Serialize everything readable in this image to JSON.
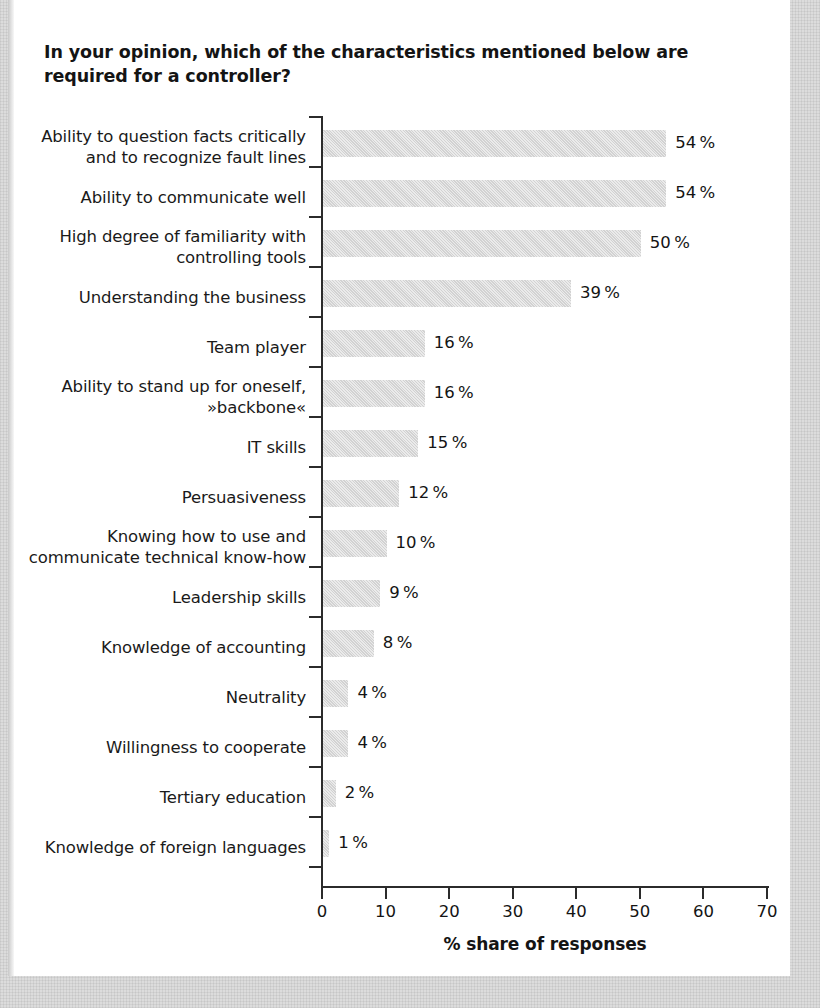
{
  "chart_data": {
    "type": "bar",
    "orientation": "horizontal",
    "title": "In your opinion, which of the characteristics mentioned below are required for a controller?",
    "xlabel": "% share of responses",
    "ylabel": "",
    "xlim": [
      0,
      70
    ],
    "xticks": [
      0,
      10,
      20,
      30,
      40,
      50,
      60,
      70
    ],
    "xtick_labels": [
      "0",
      "10",
      "20",
      "30",
      "40",
      "50",
      "60",
      "70"
    ],
    "grid": false,
    "legend": false,
    "bar_color": "#d2d2d2",
    "axis_color": "#2b2b2b",
    "text_color": "#141414",
    "categories": [
      "Ability to question facts critically and to recognize fault lines",
      "Ability to communicate well",
      "High degree of familiarity with controlling tools",
      "Understanding the business",
      "Team player",
      "Ability to stand up for oneself, »backbone«",
      "IT skills",
      "Persuasiveness",
      "Knowing how to use and communicate technical know-how",
      "Leadership skills",
      "Knowledge of accounting",
      "Neutrality",
      "Willingness to cooperate",
      "Tertiary education",
      "Knowledge of foreign languages"
    ],
    "category_lines": [
      [
        "Ability to question facts critically",
        "and to recognize fault lines"
      ],
      [
        "Ability to communicate well"
      ],
      [
        "High degree of familiarity with",
        "controlling tools"
      ],
      [
        "Understanding the business"
      ],
      [
        "Team player"
      ],
      [
        "Ability to stand up for oneself,",
        "»backbone«"
      ],
      [
        "IT skills"
      ],
      [
        "Persuasiveness"
      ],
      [
        "Knowing how to use and",
        "communicate technical know-how"
      ],
      [
        "Leadership skills"
      ],
      [
        "Knowledge of accounting"
      ],
      [
        "Neutrality"
      ],
      [
        "Willingness to cooperate"
      ],
      [
        "Tertiary education"
      ],
      [
        "Knowledge of foreign languages"
      ]
    ],
    "values": [
      54,
      54,
      50,
      39,
      16,
      16,
      15,
      12,
      10,
      9,
      8,
      4,
      4,
      2,
      1
    ],
    "value_labels": [
      "54 %",
      "54 %",
      "50 %",
      "39 %",
      "16 %",
      "16 %",
      "15 %",
      "12 %",
      "10 %",
      "9 %",
      "8 %",
      "4 %",
      "4 %",
      "2 %",
      "1 %"
    ]
  }
}
